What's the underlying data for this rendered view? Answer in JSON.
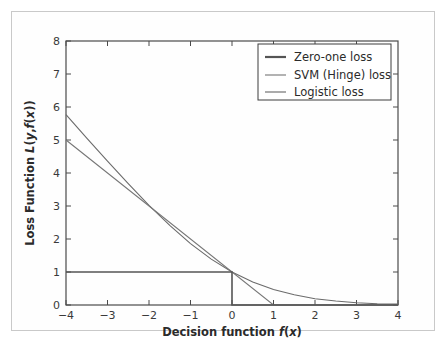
{
  "figure": {
    "background_color": "#ffffff",
    "frame_color": "#c9c9c9",
    "axes_color": "#4a4a4a"
  },
  "chart_data": {
    "type": "line",
    "title": "",
    "xlabel": "Decision function f(x)",
    "xlabel_parts": {
      "prefix": "Decision function ",
      "f": "f",
      "open": "(",
      "x": "x",
      "close": ")"
    },
    "ylabel": "Loss Function L(y, f(x))",
    "ylabel_parts": {
      "prefix": "Loss Function ",
      "L": "L",
      "open1": "(",
      "y": "y",
      "comma": ",",
      "f": "f",
      "open2": "(",
      "x": "x",
      "close2": ")",
      "close1": ")"
    },
    "xlim": [
      -4,
      4
    ],
    "ylim": [
      0,
      8
    ],
    "xticks": [
      -4,
      -3,
      -2,
      -1,
      0,
      1,
      2,
      3,
      4
    ],
    "xtick_labels": [
      "−4",
      "−3",
      "−2",
      "−1",
      "0",
      "1",
      "2",
      "3",
      "4"
    ],
    "yticks": [
      0,
      1,
      2,
      3,
      4,
      5,
      6,
      7,
      8
    ],
    "ytick_labels": [
      "0",
      "1",
      "2",
      "3",
      "4",
      "5",
      "6",
      "7",
      "8"
    ],
    "grid": false,
    "legend_position": "upper right",
    "series": [
      {
        "name": "Zero-one loss",
        "color": "#555555",
        "linewidth": 1.6,
        "formula": "step: 1 for f(x) < 0, 0 for f(x) >= 0",
        "points": [
          [
            -4,
            1
          ],
          [
            0,
            1
          ],
          [
            0,
            0
          ],
          [
            4,
            0
          ]
        ]
      },
      {
        "name": "SVM (Hinge) loss",
        "color": "#777777",
        "linewidth": 1.1,
        "formula": "max(0, 1 - f(x))",
        "points": [
          [
            -4,
            5
          ],
          [
            1,
            0
          ],
          [
            4,
            0
          ]
        ]
      },
      {
        "name": "Logistic loss",
        "color": "#6b6b6b",
        "linewidth": 1.1,
        "formula": "log2(1 + exp(-f(x)))",
        "points": [
          [
            -4,
            5.77
          ],
          [
            -3.5,
            5.06
          ],
          [
            -3,
            4.36
          ],
          [
            -2.5,
            3.68
          ],
          [
            -2,
            3.02
          ],
          [
            -1.5,
            2.41
          ],
          [
            -1,
            1.86
          ],
          [
            -0.5,
            1.39
          ],
          [
            0,
            1.0
          ],
          [
            0.5,
            0.7
          ],
          [
            1,
            0.47
          ],
          [
            1.5,
            0.31
          ],
          [
            2,
            0.19
          ],
          [
            2.5,
            0.12
          ],
          [
            3,
            0.07
          ],
          [
            3.5,
            0.04
          ],
          [
            4,
            0.03
          ]
        ]
      }
    ]
  },
  "legend": {
    "entries": [
      {
        "label": "Zero-one loss",
        "color": "#555555"
      },
      {
        "label": "SVM (Hinge) loss",
        "color": "#777777"
      },
      {
        "label": "Logistic loss",
        "color": "#6b6b6b"
      }
    ]
  },
  "caption": {
    "text": ""
  }
}
